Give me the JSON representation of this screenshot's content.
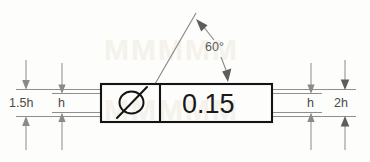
{
  "figure": {
    "frame": {
      "symbol_name": "circularity-slash-symbol",
      "tolerance_value": "0.15"
    },
    "angle_callout": {
      "label": "60°"
    },
    "dimensions": [
      {
        "id": "left-outer",
        "label": "1.5h"
      },
      {
        "id": "left-inner",
        "label": "h"
      },
      {
        "id": "right-inner",
        "label": "h"
      },
      {
        "id": "right-outer",
        "label": "2h"
      }
    ],
    "colors": {
      "frame_stroke": "#141414",
      "dimension_stroke": "#9a9a9a",
      "label_text": "#4a4a4a",
      "tolerance_text": "#1a1a1a",
      "background": "#fdfdfb"
    }
  }
}
